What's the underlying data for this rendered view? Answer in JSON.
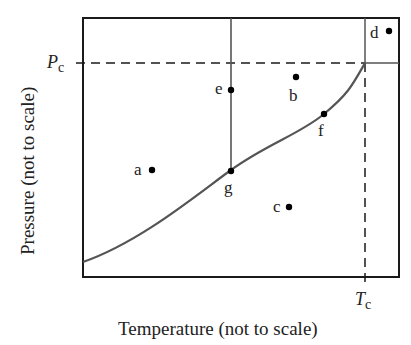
{
  "diagram": {
    "type": "phase-diagram",
    "axes": {
      "xlabel": "Temperature (not to scale)",
      "ylabel": "Pressure (not to scale)"
    },
    "critical": {
      "pressure_label_main": "P",
      "pressure_label_sub": "c",
      "temperature_label_main": "T",
      "temperature_label_sub": "c"
    },
    "points": [
      {
        "id": "a",
        "label": "a"
      },
      {
        "id": "b",
        "label": "b"
      },
      {
        "id": "c",
        "label": "c"
      },
      {
        "id": "d",
        "label": "d"
      },
      {
        "id": "e",
        "label": "e"
      },
      {
        "id": "f",
        "label": "f"
      },
      {
        "id": "g",
        "label": "g"
      }
    ],
    "colors": {
      "axes": "#1a1a1a",
      "curve": "#555555",
      "points": "#000000"
    }
  }
}
